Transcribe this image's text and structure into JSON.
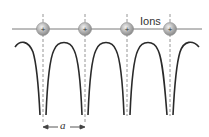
{
  "diagram": {
    "labels": {
      "ions": "Ions",
      "lattice_constant": "a"
    },
    "ions": [
      {
        "x": 43,
        "y": 29,
        "symbol": "+"
      },
      {
        "x": 85,
        "y": 29,
        "symbol": "+"
      },
      {
        "x": 127,
        "y": 29,
        "symbol": "+"
      },
      {
        "x": 170,
        "y": 29,
        "symbol": "+"
      }
    ],
    "colors": {
      "line": "#777777",
      "curve": "#2a2a2a",
      "dash": "#888888",
      "ion_fill": "#a0a0a0",
      "ion_edge": "#888888"
    }
  }
}
